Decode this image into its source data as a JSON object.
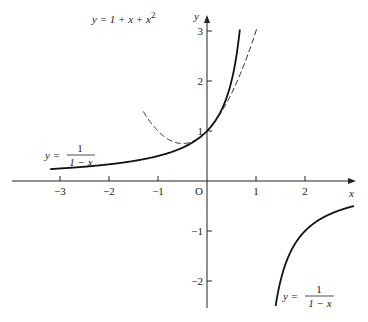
{
  "chart_data": {
    "type": "line",
    "title": "",
    "xlabel": "x",
    "ylabel": "y",
    "origin_label": "O",
    "xlim": [
      -4,
      3
    ],
    "ylim": [
      -2.6,
      3.3
    ],
    "x_ticks": [
      -3,
      -2,
      -1,
      1,
      2
    ],
    "x_tick_labels": [
      "−3",
      "−2",
      "−1",
      "1",
      "2"
    ],
    "y_ticks": [
      -2,
      -1,
      1,
      2,
      3
    ],
    "y_tick_labels": [
      "−2",
      "−1",
      "1",
      "2",
      "3"
    ],
    "grid": false,
    "series": [
      {
        "name": "y = 1/(1 − x) (left branch)",
        "style": "solid",
        "function": "1/(1-x)",
        "domain": [
          -3.2,
          0.67
        ]
      },
      {
        "name": "y = 1/(1 − x) (right branch)",
        "style": "solid",
        "function": "1/(1-x)",
        "domain": [
          1.4,
          3.0
        ]
      },
      {
        "name": "y = 1 + x + x²",
        "style": "dashed",
        "function": "1+x+x^2",
        "domain": [
          -1.3,
          1.02
        ]
      }
    ],
    "annotations": {
      "quadratic": {
        "prefix": "y = 1 + x + x",
        "sup": "2"
      },
      "rational_left": {
        "lhs": "y =",
        "num": "1",
        "den": "1 − x"
      },
      "rational_right": {
        "lhs": "y =",
        "num": "1",
        "den": "1 − x"
      }
    }
  }
}
